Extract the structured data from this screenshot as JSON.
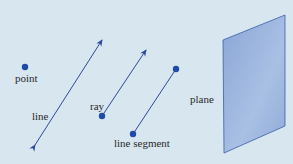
{
  "labels": {
    "point": "point",
    "line": "line",
    "ray": "ray",
    "segment": "line segment",
    "plane": "plane"
  },
  "colors": {
    "background": "#d8e6f0",
    "stroke": "#2b4a9a",
    "dot": "#1f4aa8",
    "plane_fill": "#8fabd8",
    "plane_edge": "#3a5ea8"
  }
}
